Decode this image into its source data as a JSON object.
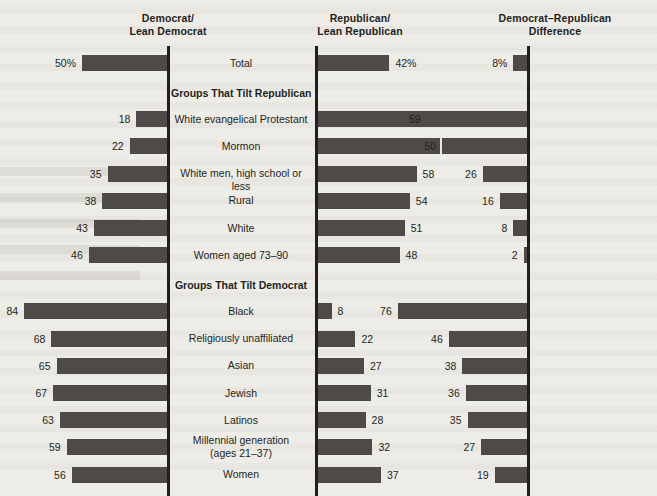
{
  "headers": {
    "col1": "Democrat/\nLean Democrat",
    "col2": "Republican/\nLean Republican",
    "col3": "Democrat–Republican\nDifference"
  },
  "group_titles": {
    "republican": "Groups That Tilt Republican",
    "democrat": "Groups That Tilt Democrat"
  },
  "colors": {
    "bar": "#4d4a48",
    "axis": "#231f20",
    "background": "#eeece7",
    "text": "#231f20"
  },
  "chart_data": {
    "type": "bar",
    "title": "",
    "xlabel": "",
    "ylabel": "",
    "xlim": [
      0,
      100
    ],
    "grid": false,
    "legend": "none",
    "orientation": "horizontal",
    "note": "Diverging three-panel bar chart. Panel 1 (Democrat/Lean Democrat) bars extend leftward from a right-hand axis; Panel 2 (Republican/Lean Republican) bars extend rightward from a left-hand axis; Panel 3 (Democrat-Republican Difference) bars extend leftward from a right-hand axis.",
    "series": [
      {
        "name": "Democrat/Lean Democrat",
        "direction": "left"
      },
      {
        "name": "Republican/Lean Republican",
        "direction": "right"
      },
      {
        "name": "Democrat–Republican Difference",
        "direction": "left"
      }
    ],
    "categories": [
      "Total",
      "White evangelical Protestant",
      "Mormon",
      "White men, high school or less",
      "Rural",
      "White",
      "Women aged 73–90",
      "Black",
      "Religiously unaffiliated",
      "Asian",
      "Jewish",
      "Latinos",
      "Millennial generation (ages 21–37)",
      "Women"
    ],
    "values": {
      "democrat": [
        50,
        18,
        22,
        35,
        38,
        43,
        46,
        84,
        68,
        65,
        67,
        63,
        59,
        56
      ],
      "republican": [
        42,
        77,
        72,
        58,
        54,
        51,
        48,
        8,
        22,
        27,
        31,
        28,
        32,
        37
      ],
      "difference": [
        8,
        59,
        50,
        26,
        16,
        8,
        2,
        76,
        46,
        38,
        36,
        35,
        27,
        19
      ]
    }
  },
  "rows": [
    {
      "kind": "row",
      "label": "Total",
      "dem": "50%",
      "rep": "42%",
      "diff": "8%",
      "dem_v": 50,
      "rep_v": 42,
      "diff_v": 8
    },
    {
      "kind": "group",
      "label": "Groups That Tilt Republican"
    },
    {
      "kind": "row",
      "label": "White evangelical Protestant",
      "dem": "18",
      "rep": "77",
      "diff": "59",
      "dem_v": 18,
      "rep_v": 77,
      "diff_v": 59
    },
    {
      "kind": "row",
      "label": "Mormon",
      "dem": "22",
      "rep": "72",
      "diff": "50",
      "dem_v": 22,
      "rep_v": 72,
      "diff_v": 50
    },
    {
      "kind": "row",
      "label": "White men, high school or less",
      "dem": "35",
      "rep": "58",
      "diff": "26",
      "dem_v": 35,
      "rep_v": 58,
      "diff_v": 26
    },
    {
      "kind": "row",
      "label": "Rural",
      "dem": "38",
      "rep": "54",
      "diff": "16",
      "dem_v": 38,
      "rep_v": 54,
      "diff_v": 16
    },
    {
      "kind": "row",
      "label": "White",
      "dem": "43",
      "rep": "51",
      "diff": "8",
      "dem_v": 43,
      "rep_v": 51,
      "diff_v": 8
    },
    {
      "kind": "row",
      "label": "Women aged 73–90",
      "dem": "46",
      "rep": "48",
      "diff": "2",
      "dem_v": 46,
      "rep_v": 48,
      "diff_v": 2
    },
    {
      "kind": "group",
      "label": "Groups That Tilt Democrat"
    },
    {
      "kind": "row",
      "label": "Black",
      "dem": "84",
      "rep": "8",
      "diff": "76",
      "dem_v": 84,
      "rep_v": 8,
      "diff_v": 76
    },
    {
      "kind": "row",
      "label": "Religiously unaffiliated",
      "dem": "68",
      "rep": "22",
      "diff": "46",
      "dem_v": 68,
      "rep_v": 22,
      "diff_v": 46
    },
    {
      "kind": "row",
      "label": "Asian",
      "dem": "65",
      "rep": "27",
      "diff": "38",
      "dem_v": 65,
      "rep_v": 27,
      "diff_v": 38
    },
    {
      "kind": "row",
      "label": "Jewish",
      "dem": "67",
      "rep": "31",
      "diff": "36",
      "dem_v": 67,
      "rep_v": 31,
      "diff_v": 36
    },
    {
      "kind": "row",
      "label": "Latinos",
      "dem": "63",
      "rep": "28",
      "diff": "35",
      "dem_v": 63,
      "rep_v": 28,
      "diff_v": 35
    },
    {
      "kind": "row",
      "label": "Millennial generation\n(ages 21–37)",
      "dem": "59",
      "rep": "32",
      "diff": "27",
      "dem_v": 59,
      "rep_v": 32,
      "diff_v": 27
    },
    {
      "kind": "row",
      "label": "Women",
      "dem": "56",
      "rep": "37",
      "diff": "19",
      "dem_v": 56,
      "rep_v": 37,
      "diff_v": 19
    }
  ]
}
